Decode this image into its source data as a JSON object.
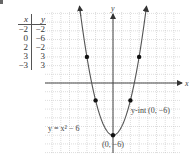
{
  "problem_fragment": "",
  "table": {
    "headers": {
      "x": "x",
      "y": "y"
    },
    "rows": [
      {
        "x": "−2",
        "y": "−2"
      },
      {
        "x": "0",
        "y": "−6"
      },
      {
        "x": "2",
        "y": "−2"
      },
      {
        "x": "3",
        "y": "3"
      },
      {
        "x": "−3",
        "y": "3"
      }
    ]
  },
  "graph": {
    "x_axis_label": "x",
    "y_axis_label": "y",
    "equation_label": "y = x² − 6",
    "intercept_label": "y-int (0, −6)",
    "vertex_label": "(0, −6)",
    "curve_color": "#555555",
    "axis_color": "#444444",
    "grid_color": "#bbbbbb"
  },
  "chart_data": {
    "type": "line",
    "title": "",
    "function": "y = x^2 - 6",
    "xlabel": "x",
    "ylabel": "y",
    "points": [
      {
        "x": -3,
        "y": 3
      },
      {
        "x": -2,
        "y": -2
      },
      {
        "x": 0,
        "y": -6
      },
      {
        "x": 2,
        "y": -2
      },
      {
        "x": 3,
        "y": 3
      }
    ],
    "annotations": [
      "y = x² − 6",
      "y-int (0, −6)",
      "(0, −6)"
    ],
    "xlim": [
      -8,
      8
    ],
    "ylim": [
      -8,
      8
    ],
    "grid": true,
    "legend": "none"
  }
}
